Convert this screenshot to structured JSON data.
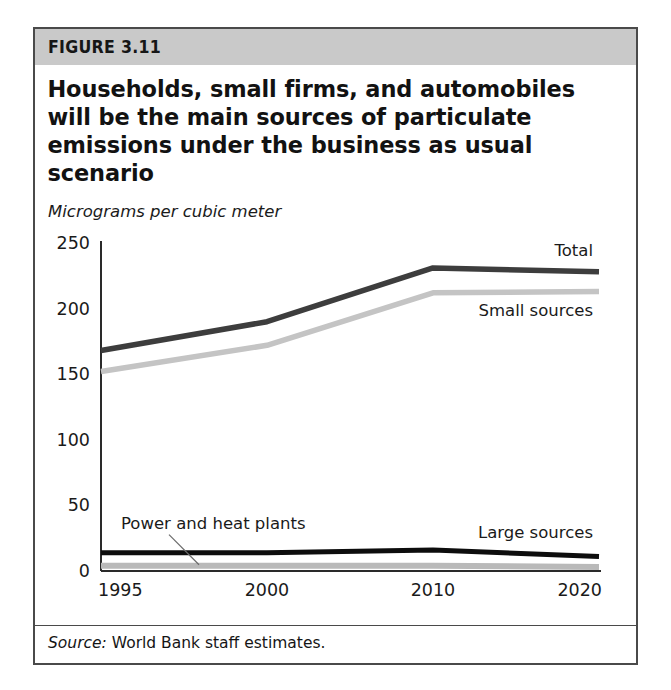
{
  "figure": {
    "header_label": "FIGURE 3.11",
    "title": "Households, small firms, and automobiles will be the main sources of particulate emissions under the business as usual scenario",
    "subtitle": "Micrograms per cubic meter",
    "source_lead": "Source:",
    "source_text": "World Bank staff estimates."
  },
  "colors": {
    "header_band": "#c9c9c9",
    "frame_border": "#4a4a4a",
    "total_line": "#3d3d3d",
    "small_sources_line": "#c4c4c4",
    "large_sources_line": "#0d0d0d",
    "power_heat_line": "#b9b9b9",
    "axis": "#2a2a2a",
    "text": "#1a1a1a"
  },
  "chart_data": {
    "type": "line",
    "title": "Households, small firms, and automobiles will be the main sources of particulate emissions under the business as usual scenario",
    "subtitle": "Micrograms per cubic meter",
    "xlabel": "",
    "ylabel": "Micrograms per cubic meter",
    "categories": [
      "1995",
      "2000",
      "2010",
      "2020"
    ],
    "x_tick_labels": [
      "1995",
      "2000",
      "2010",
      "2020"
    ],
    "y_tick_labels": [
      "0",
      "50",
      "100",
      "150",
      "200",
      "250"
    ],
    "y_ticks": [
      0,
      50,
      100,
      150,
      200,
      250
    ],
    "ylim": [
      0,
      250
    ],
    "grid": false,
    "legend_position": "inline-labels",
    "series": [
      {
        "name": "Total",
        "label": "Total",
        "color": "#3d3d3d",
        "values": [
          168,
          190,
          231,
          228
        ]
      },
      {
        "name": "Small sources",
        "label": "Small sources",
        "color": "#c4c4c4",
        "values": [
          152,
          172,
          212,
          213
        ]
      },
      {
        "name": "Large sources",
        "label": "Large sources",
        "color": "#0d0d0d",
        "values": [
          14,
          14,
          16,
          11
        ]
      },
      {
        "name": "Power and heat plants",
        "label": "Power and heat plants",
        "color": "#b9b9b9",
        "values": [
          4,
          4,
          4,
          3
        ]
      }
    ],
    "annotations": [
      {
        "text": "Total",
        "series": "Total"
      },
      {
        "text": "Small sources",
        "series": "Small sources"
      },
      {
        "text": "Large sources",
        "series": "Large sources"
      },
      {
        "text": "Power and heat plants",
        "series": "Power and heat plants",
        "has_leader_line": true
      }
    ]
  }
}
